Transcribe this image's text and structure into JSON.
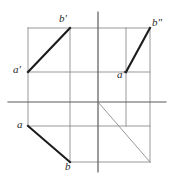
{
  "figure": {
    "type": "descriptive-geometry-projection",
    "canvas": {
      "width": 173,
      "height": 179
    },
    "colors": {
      "segment": "#1c1c1c",
      "frame": "#8c8c8c",
      "axis": "#5a5a5a",
      "diagonal": "#8c8c8c",
      "label": "#2b2b2b",
      "background": "#ffffff"
    },
    "axes": {
      "origin": {
        "x": 98,
        "y": 102
      },
      "horizontal": {
        "x1": 8,
        "y1": 102,
        "x2": 166,
        "y2": 102
      },
      "vertical": {
        "x1": 98,
        "y1": 12,
        "x2": 98,
        "y2": 172
      }
    },
    "frame_lines": [
      {
        "name": "top-rail",
        "x1": 28,
        "y1": 28,
        "x2": 150,
        "y2": 28
      },
      {
        "name": "mid-rail",
        "x1": 28,
        "y1": 72,
        "x2": 150,
        "y2": 72
      },
      {
        "name": "lower-rail",
        "x1": 28,
        "y1": 126,
        "x2": 150,
        "y2": 126
      },
      {
        "name": "bottom-rail",
        "x1": 70,
        "y1": 162,
        "x2": 150,
        "y2": 162
      },
      {
        "name": "left-post",
        "x1": 28,
        "y1": 28,
        "x2": 28,
        "y2": 126
      },
      {
        "name": "inner-left-post",
        "x1": 70,
        "y1": 28,
        "x2": 70,
        "y2": 162
      },
      {
        "name": "inner-right-post",
        "x1": 126,
        "y1": 28,
        "x2": 126,
        "y2": 126
      },
      {
        "name": "right-post",
        "x1": 150,
        "y1": 28,
        "x2": 150,
        "y2": 162
      }
    ],
    "diagonal": {
      "name": "45-degree-reference-line",
      "x1": 98,
      "y1": 102,
      "x2": 150,
      "y2": 162
    },
    "segments": [
      {
        "name": "front-view-segment",
        "from": "a'",
        "to": "b'",
        "x1": 28,
        "y1": 72,
        "x2": 70,
        "y2": 28
      },
      {
        "name": "side-view-segment",
        "from": "a\"",
        "to": "b\"",
        "x1": 126,
        "y1": 72,
        "x2": 150,
        "y2": 28
      },
      {
        "name": "top-view-segment",
        "from": "a",
        "to": "b",
        "x1": 28,
        "y1": 126,
        "x2": 70,
        "y2": 162
      }
    ],
    "labels": [
      {
        "key": "b-prime",
        "text": "b'",
        "x": 59,
        "y": 13
      },
      {
        "key": "b-double-prime",
        "text": "b\"",
        "x": 152,
        "y": 17
      },
      {
        "key": "a-prime",
        "text": "a'",
        "x": 13,
        "y": 64
      },
      {
        "key": "a-double-prime",
        "text": "a\"",
        "x": 117,
        "y": 69
      },
      {
        "key": "a",
        "text": "a",
        "x": 17,
        "y": 119
      },
      {
        "key": "b",
        "text": "b",
        "x": 65,
        "y": 161
      }
    ]
  }
}
